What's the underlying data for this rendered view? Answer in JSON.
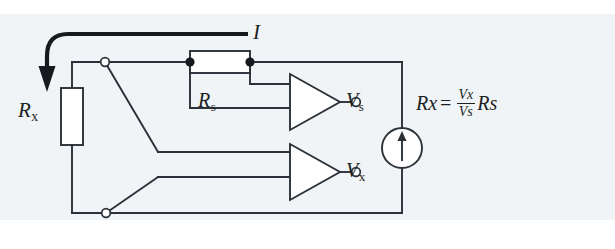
{
  "figure": {
    "background": "#f1f4f6",
    "line_color": "#2b3138",
    "label_color": "#1b1f24"
  },
  "labels": {
    "rx": {
      "base": "R",
      "sub": "x"
    },
    "rs": {
      "base": "R",
      "sub": "s"
    },
    "current": "I",
    "vs": {
      "base": "V",
      "sub": "s"
    },
    "vx": {
      "base": "V",
      "sub": "x"
    }
  },
  "formula": {
    "lhs_base": "R",
    "lhs_sub": "x",
    "equals": "=",
    "numerator_base": "V",
    "numerator_sub": "x",
    "denominator_base": "V",
    "denominator_sub": "s",
    "rhs_base": "R",
    "rhs_sub": "s",
    "plain": "R_x = (V_x / V_s) R_s"
  },
  "components": [
    {
      "name": "unknown-resistor",
      "label": "R_x",
      "type": "resistor"
    },
    {
      "name": "sense-resistor",
      "label": "R_s",
      "type": "resistor"
    },
    {
      "name": "current-source",
      "label": "I",
      "type": "current-source",
      "direction": "up"
    },
    {
      "name": "amplifier-vs",
      "label": "V_s",
      "type": "amplifier"
    },
    {
      "name": "amplifier-vx",
      "label": "V_x",
      "type": "amplifier"
    }
  ],
  "terminals": [
    {
      "name": "kelvin-terminal-top",
      "style": "open-circle"
    },
    {
      "name": "kelvin-terminal-bottom",
      "style": "open-circle"
    },
    {
      "name": "output-terminal-vs",
      "style": "open-circle"
    },
    {
      "name": "output-terminal-vx",
      "style": "open-circle"
    },
    {
      "name": "junction-rs-left",
      "style": "filled-dot"
    },
    {
      "name": "junction-rs-right",
      "style": "filled-dot"
    }
  ]
}
